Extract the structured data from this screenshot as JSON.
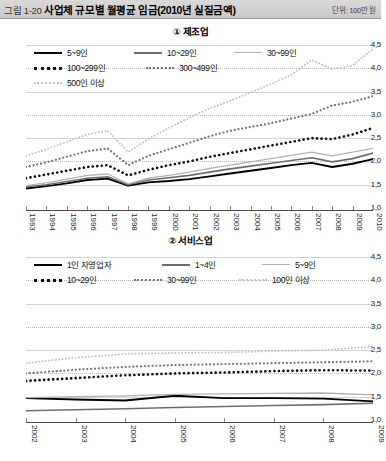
{
  "header": {
    "figure_no": "그림 1-20",
    "title": "사업체 규모별 월평균 임금(2010년 실질금액)",
    "unit": "단위: 100만 원"
  },
  "panel1": {
    "title": "① 제조업"
  },
  "panel2": {
    "title": "② 서비스업"
  },
  "chart_data": [
    {
      "type": "line",
      "id": "manufacturing",
      "title": "① 제조업",
      "xlabel": "",
      "ylabel": "",
      "unit": "단위: 100만 원",
      "ylim": [
        1.0,
        4.5
      ],
      "yticks": [
        "1,0",
        "1,5",
        "2,0",
        "2,5",
        "3,0",
        "3,5",
        "4,0",
        "4,5"
      ],
      "ytick_values": [
        1.0,
        1.5,
        2.0,
        2.5,
        3.0,
        3.5,
        4.0,
        4.5
      ],
      "grid": true,
      "legend_position": "top-left",
      "categories": [
        "1993",
        "1994",
        "1995",
        "1996",
        "1997",
        "1998",
        "1999",
        "2000",
        "2001",
        "2002",
        "2003",
        "2004",
        "2005",
        "2006",
        "2007",
        "2008",
        "2009",
        "2010"
      ],
      "series": [
        {
          "name": "5~9인",
          "style": "solid",
          "color": "#000000",
          "values": [
            1.42,
            1.47,
            1.53,
            1.6,
            1.63,
            1.48,
            1.55,
            1.58,
            1.62,
            1.68,
            1.74,
            1.8,
            1.86,
            1.92,
            1.97,
            1.88,
            1.95,
            2.05
          ]
        },
        {
          "name": "10~29인",
          "style": "solid",
          "color": "#6e6e6e",
          "values": [
            1.45,
            1.5,
            1.57,
            1.64,
            1.67,
            1.5,
            1.6,
            1.65,
            1.7,
            1.77,
            1.84,
            1.9,
            1.96,
            2.02,
            2.08,
            1.99,
            2.06,
            2.18
          ]
        },
        {
          "name": "30~99인",
          "style": "solid",
          "color": "#b2b2b2",
          "values": [
            1.48,
            1.54,
            1.62,
            1.7,
            1.73,
            1.52,
            1.64,
            1.7,
            1.77,
            1.85,
            1.92,
            1.99,
            2.06,
            2.13,
            2.2,
            2.12,
            2.2,
            2.28
          ]
        },
        {
          "name": "100~299인",
          "style": "dotted",
          "color": "#111111",
          "values": [
            1.64,
            1.72,
            1.8,
            1.88,
            1.92,
            1.7,
            1.82,
            1.92,
            2.0,
            2.1,
            2.18,
            2.26,
            2.34,
            2.42,
            2.5,
            2.48,
            2.58,
            2.72
          ]
        },
        {
          "name": "300~499인",
          "style": "dotted",
          "color": "#777777",
          "values": [
            1.88,
            1.98,
            2.1,
            2.22,
            2.28,
            1.92,
            2.12,
            2.26,
            2.4,
            2.54,
            2.66,
            2.74,
            2.82,
            2.92,
            3.02,
            3.2,
            3.28,
            3.4
          ]
        },
        {
          "name": "500인 이상",
          "style": "dotted",
          "color": "#c2c2c2",
          "values": [
            2.12,
            2.26,
            2.42,
            2.58,
            2.66,
            2.2,
            2.48,
            2.72,
            2.94,
            3.14,
            3.3,
            3.48,
            3.66,
            3.86,
            4.18,
            3.98,
            4.06,
            4.42
          ]
        }
      ]
    },
    {
      "type": "line",
      "id": "services",
      "title": "② 서비스업",
      "xlabel": "",
      "ylabel": "",
      "unit": "단위: 100만 원",
      "ylim": [
        1.0,
        4.5
      ],
      "yticks": [
        "1,0",
        "1,5",
        "2,0",
        "2,5",
        "3,0",
        "3,5",
        "4,0",
        "4,5"
      ],
      "ytick_values": [
        1.0,
        1.5,
        2.0,
        2.5,
        3.0,
        3.5,
        4.0,
        4.5
      ],
      "grid": true,
      "legend_position": "top-left",
      "categories": [
        "2002",
        "2003",
        "2004",
        "2005",
        "2006",
        "2007",
        "2008",
        "2009"
      ],
      "series": [
        {
          "name": "1인 자영업자",
          "style": "solid",
          "color": "#000000",
          "values": [
            1.47,
            1.44,
            1.42,
            1.52,
            1.47,
            1.47,
            1.46,
            1.4
          ]
        },
        {
          "name": "1~4인",
          "style": "solid",
          "color": "#6e6e6e",
          "values": [
            1.2,
            1.22,
            1.24,
            1.27,
            1.29,
            1.31,
            1.33,
            1.36
          ]
        },
        {
          "name": "5~9인",
          "style": "solid",
          "color": "#b2b2b2",
          "values": [
            1.48,
            1.5,
            1.52,
            1.55,
            1.56,
            1.57,
            1.58,
            1.54
          ]
        },
        {
          "name": "10~29인",
          "style": "dotted",
          "color": "#111111",
          "values": [
            1.84,
            1.9,
            1.96,
            2.0,
            2.02,
            2.05,
            2.07,
            2.06
          ]
        },
        {
          "name": "30~99인",
          "style": "dotted",
          "color": "#777777",
          "values": [
            2.0,
            2.08,
            2.14,
            2.18,
            2.2,
            2.22,
            2.24,
            2.26
          ]
        },
        {
          "name": "100인 이상",
          "style": "dotted",
          "color": "#c2c2c2",
          "values": [
            2.22,
            2.34,
            2.42,
            2.44,
            2.45,
            2.48,
            2.5,
            2.58
          ]
        }
      ]
    }
  ]
}
